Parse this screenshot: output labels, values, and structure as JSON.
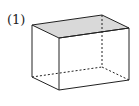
{
  "label": "(1)",
  "figure": {
    "type": "rectangular-prism",
    "shaded_face": "top",
    "shade_color": "#d9d9d9",
    "line_color": "#222222",
    "hidden_edges": "dashed"
  }
}
